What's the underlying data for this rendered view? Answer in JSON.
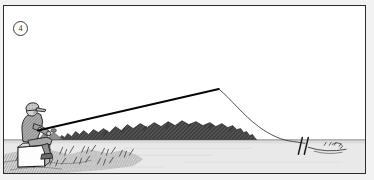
{
  "panel": {
    "number_label": "4",
    "caption_alt": "An angler seated on a white tackle box on a grassy bank, fishing rod bent with line running out to a float on open water",
    "frame_color": "#2b2b2b",
    "background_color": "#ffffff"
  },
  "scene": {
    "sky": {
      "name": "sky",
      "color": "#ffffff"
    },
    "water": {
      "name": "water-surface",
      "color": "#e8e8e8",
      "waterline_y": 140,
      "label": "Water"
    },
    "far_bank": {
      "name": "far-bank-vegetation",
      "color": "#4a4a4a",
      "label": "Distant reed and bush line"
    },
    "near_bank": {
      "name": "near-bank-grass",
      "color": "#6e6e6e",
      "label": "Foreground grass tufts"
    },
    "angler": {
      "name": "seated-angler",
      "label": "Angler",
      "cap_color": "#9a9a9a",
      "jacket_color": "#8a8a8a",
      "outline_color": "#1f1f1f"
    },
    "tackle_box": {
      "name": "tackle-box",
      "label": "Tackle box seat",
      "fill_color": "#fdfdfd",
      "outline_color": "#1f1f1f"
    },
    "rod": {
      "name": "fishing-rod",
      "label": "Fishing rod",
      "color": "#111111",
      "butt_x": 44,
      "butt_y": 129,
      "tip_x": 219,
      "tip_y": 88
    },
    "line": {
      "name": "fishing-line",
      "label": "Fishing line",
      "color": "#333333",
      "entry_x": 291,
      "entry_y": 141
    },
    "float": {
      "name": "float-bobber",
      "label": "Float",
      "color": "#1f1f1f",
      "x": 303,
      "y": 141
    },
    "ripples": {
      "name": "water-ripples",
      "label": "Surface ripples",
      "color": "#4a4a4a"
    }
  }
}
